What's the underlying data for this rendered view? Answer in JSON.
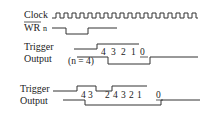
{
  "figure": {
    "signals": {
      "clock": {
        "label": "Clock"
      },
      "wr": {
        "label": "WR",
        "suffix": "n",
        "active_low": true
      },
      "trigger1": {
        "label": "Trigger"
      },
      "output1": {
        "label": "Output",
        "annotation": "(n = 4)"
      },
      "trigger2": {
        "label": "Trigger"
      },
      "output2": {
        "label": "Output"
      }
    },
    "count_sequence_1": [
      "4",
      "3",
      "2",
      "1",
      "0"
    ],
    "count_sequence_2": [
      "4",
      "3",
      "2",
      "4",
      "3",
      "2",
      "1",
      "0"
    ]
  },
  "colors": {
    "line": "#333333",
    "text": "#222222",
    "background": "#ffffff"
  }
}
